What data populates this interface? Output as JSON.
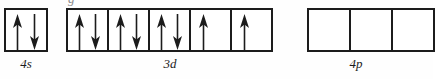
{
  "diagram": {
    "type": "orbital-box-diagram",
    "top_artifact_text": "g",
    "colors": {
      "box_border": "#1c1c1c",
      "arrow": "#1c1c1c",
      "background": "#ffffff",
      "label_text": "#1c1c1c"
    },
    "groups": [
      {
        "id": "4s",
        "label": "4s",
        "left_px": 4,
        "box_width_px": 44,
        "box_count": 1,
        "label_center_px": 26,
        "boxes": [
          {
            "index": 0,
            "electrons": [
              "up",
              "down"
            ]
          }
        ]
      },
      {
        "id": "3d",
        "label": "3d",
        "left_px": 66,
        "box_width_px": 43,
        "box_count": 5,
        "label_center_px": 170,
        "boxes": [
          {
            "index": 0,
            "electrons": [
              "up",
              "down"
            ]
          },
          {
            "index": 1,
            "electrons": [
              "up",
              "down"
            ]
          },
          {
            "index": 2,
            "electrons": [
              "up",
              "down"
            ]
          },
          {
            "index": 3,
            "electrons": [
              "up"
            ]
          },
          {
            "index": 4,
            "electrons": [
              "up"
            ]
          }
        ]
      },
      {
        "id": "4p",
        "label": "4p",
        "left_px": 307,
        "box_width_px": 44,
        "box_count": 3,
        "label_center_px": 356,
        "boxes": [
          {
            "index": 0,
            "electrons": []
          },
          {
            "index": 1,
            "electrons": []
          },
          {
            "index": 2,
            "electrons": []
          }
        ]
      }
    ],
    "summary": {
      "total_electrons": 8,
      "paired_orbitals": 4,
      "unpaired_electrons": 2,
      "empty_orbitals": 5
    }
  }
}
